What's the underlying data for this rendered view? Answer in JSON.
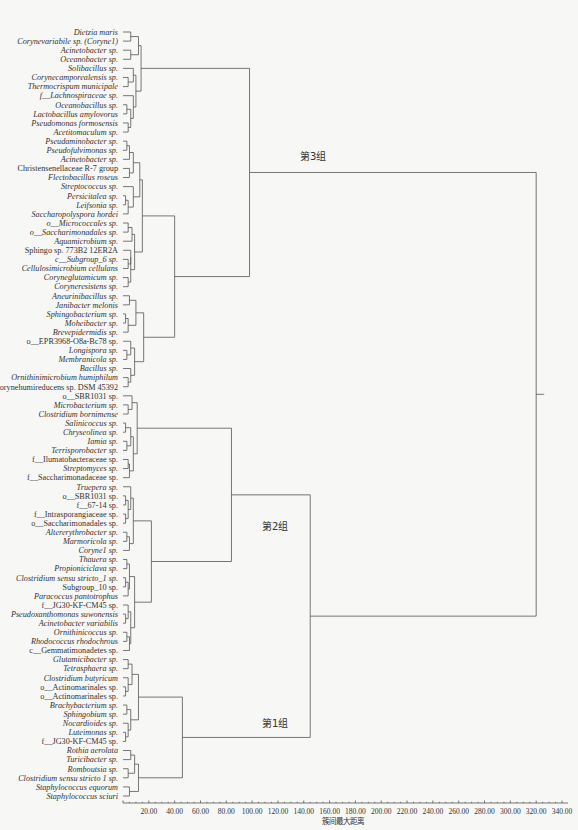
{
  "chart_data": {
    "type": "dendrogram",
    "title": "",
    "xlabel": "簇间最大距离",
    "xlim": [
      0,
      340
    ],
    "x_ticks": [
      "20.00",
      "40.00",
      "60.00",
      "80.00",
      "100.00",
      "120.00",
      "140.00",
      "160.00",
      "180.00",
      "200.00",
      "220.00",
      "240.00",
      "260.00",
      "280.00",
      "300.00",
      "320.00",
      "340.00"
    ],
    "groups": [
      {
        "label": "第3组",
        "first_leaf": 0,
        "last_leaf": 37
      },
      {
        "label": "第2组",
        "first_leaf": 38,
        "last_leaf": 63
      },
      {
        "label": "第1组",
        "first_leaf": 64,
        "last_leaf": 75
      }
    ],
    "leaves": [
      {
        "name": "Dietzia maris",
        "italic": true
      },
      {
        "name": "Corynevariabile sp. (Coryne1)",
        "italic": true
      },
      {
        "name": "Acinetobacter sp.",
        "italic": true
      },
      {
        "name": "Oceanobacter sp.",
        "italic": true
      },
      {
        "name": "Solibacillus sp.",
        "italic": true
      },
      {
        "name": "Corynecamporealensis sp.",
        "italic": true
      },
      {
        "name": "Thermocrispum municipale",
        "italic": true
      },
      {
        "name": "f__Lachnospiraceae sp.",
        "italic": true
      },
      {
        "name": "Oceanobacillus sp.",
        "italic": true
      },
      {
        "name": "Lactobacillus amylovorus",
        "italic": true
      },
      {
        "name": "Pseudomonas formosensis",
        "italic": true
      },
      {
        "name": "Acetitomaculum sp.",
        "italic": true
      },
      {
        "name": "Pseudaminobacter sp.",
        "italic": true
      },
      {
        "name": "Pseudofulvimonas sp.",
        "italic": true
      },
      {
        "name": "Acinetobacter sp.",
        "italic": true
      },
      {
        "name": "Christensenellaceae R-7 group",
        "italic": false
      },
      {
        "name": "Flectobacillus roseus",
        "italic": true
      },
      {
        "name": "Streptococcus sp.",
        "italic": true
      },
      {
        "name": "Persicitalea sp.",
        "italic": true
      },
      {
        "name": "Leifsonia sp.",
        "italic": true
      },
      {
        "name": "Saccharopolyspora hordei",
        "italic": true
      },
      {
        "name": "o__Micrococcales sp.",
        "italic": true
      },
      {
        "name": "o__Saccharimonadales sp.",
        "italic": true
      },
      {
        "name": "Aquamicrobium sp.",
        "italic": true
      },
      {
        "name": "Sphingo sp. 773B2 12ER2A",
        "italic": false
      },
      {
        "name": "c__Subgroup_6 sp.",
        "italic": true
      },
      {
        "name": "Cellulosimicrobium cellulans",
        "italic": true
      },
      {
        "name": "Coryneglutamicum sp.",
        "italic": true
      },
      {
        "name": "Coryneresistens sp.",
        "italic": true
      },
      {
        "name": "Aneurinibacillus sp.",
        "italic": true
      },
      {
        "name": "Janibacter melonis",
        "italic": true
      },
      {
        "name": "Sphingobacterium sp.",
        "italic": true
      },
      {
        "name": "Moheibacter sp.",
        "italic": true
      },
      {
        "name": "Brevepidermidis sp.",
        "italic": true
      },
      {
        "name": "o__EPR3968-O8a-Bc78 sp.",
        "italic": false
      },
      {
        "name": "Longispora sp.",
        "italic": true
      },
      {
        "name": "Membranicola sp.",
        "italic": true
      },
      {
        "name": "Bacillus sp.",
        "italic": true
      },
      {
        "name": "Ornithinimicrobium humiphilum",
        "italic": true
      },
      {
        "name": "Corynehumireducens sp. DSM 45392",
        "italic": false
      },
      {
        "name": "o__SBR1031 sp.",
        "italic": false
      },
      {
        "name": "Microbacterium sp.",
        "italic": true
      },
      {
        "name": "Clostridium bornimense",
        "italic": true
      },
      {
        "name": "Salinicoccus sp.",
        "italic": true
      },
      {
        "name": "Chryseolinea sp.",
        "italic": true
      },
      {
        "name": "Iamia sp.",
        "italic": true
      },
      {
        "name": "Terrisporobacter sp.",
        "italic": true
      },
      {
        "name": "f__Ilumatobacteraceae sp.",
        "italic": false
      },
      {
        "name": "Streptomyces sp.",
        "italic": true
      },
      {
        "name": "f__Saccharimonadaceae sp.",
        "italic": false
      },
      {
        "name": "Truepera sp.",
        "italic": true
      },
      {
        "name": "o__SBR1031 sp.",
        "italic": false
      },
      {
        "name": "f__67-14 sp.",
        "italic": false
      },
      {
        "name": "f__Intrasporangiaceae sp.",
        "italic": false
      },
      {
        "name": "o__Saccharimonadales sp.",
        "italic": false
      },
      {
        "name": "Altererythrobacter sp.",
        "italic": true
      },
      {
        "name": "Marmoricola sp.",
        "italic": true
      },
      {
        "name": "Coryne1 sp.",
        "italic": true
      },
      {
        "name": "Thauera sp.",
        "italic": true
      },
      {
        "name": "Propioniciclava sp.",
        "italic": true
      },
      {
        "name": "Clostridium sensu stricto_1 sp.",
        "italic": true
      },
      {
        "name": "Subgroup_10 sp.",
        "italic": false
      },
      {
        "name": "Paracoccus pantotrophus",
        "italic": true
      },
      {
        "name": "f__JG30-KF-CM45 sp.",
        "italic": false
      },
      {
        "name": "Pseudoxanthomonas suwonensis",
        "italic": true
      },
      {
        "name": "Acinetobacter variabilis",
        "italic": true
      },
      {
        "name": "Ornithinicoccus sp.",
        "italic": true
      },
      {
        "name": "Rhodococcus rhodochrous",
        "italic": true
      },
      {
        "name": "c__Gemmatimonadetes sp.",
        "italic": false
      },
      {
        "name": "Glutamicibacter sp.",
        "italic": true
      },
      {
        "name": "Tetrasphaera sp.",
        "italic": true
      },
      {
        "name": "Clostridium butyricum",
        "italic": true
      },
      {
        "name": "o__Actinomarinales sp.",
        "italic": false
      },
      {
        "name": "o__Actinomarinales sp.",
        "italic": false
      },
      {
        "name": "Brachybacterium sp.",
        "italic": true
      },
      {
        "name": "Sphingobium sp.",
        "italic": true
      },
      {
        "name": "Nocardioides sp.",
        "italic": true
      },
      {
        "name": "Luteimonas sp.",
        "italic": true
      },
      {
        "name": "f__JG30-KF-CM45 sp.",
        "italic": false
      },
      {
        "name": "Rothia aerolata",
        "italic": true
      },
      {
        "name": "Turicibacter sp.",
        "italic": true
      },
      {
        "name": "Romboutsia sp.",
        "italic": true
      },
      {
        "name": "Clostridium sensu stricto 1 sp.",
        "italic": true
      },
      {
        "name": "Staphylococcus equorum",
        "italic": true
      },
      {
        "name": "Staphylococcus sciuri",
        "italic": true
      }
    ],
    "merges": [
      {
        "a": "L0",
        "b": "L1",
        "h": 6,
        "id": "m0"
      },
      {
        "a": "L2",
        "b": "L3",
        "h": 6,
        "id": "m1"
      },
      {
        "a": "m0",
        "b": "m1",
        "h": 12,
        "id": "m2"
      },
      {
        "a": "L5",
        "b": "L6",
        "h": 4,
        "id": "m3"
      },
      {
        "a": "L4",
        "b": "m3",
        "h": 8,
        "id": "m4"
      },
      {
        "a": "L8",
        "b": "L9",
        "h": 3,
        "id": "m5"
      },
      {
        "a": "L10",
        "b": "L11",
        "h": 4,
        "id": "m6"
      },
      {
        "a": "m5",
        "b": "m6",
        "h": 6,
        "id": "m7"
      },
      {
        "a": "L7",
        "b": "m7",
        "h": 8,
        "id": "m7b"
      },
      {
        "a": "m4",
        "b": "m7b",
        "h": 10,
        "id": "m8"
      },
      {
        "a": "m2",
        "b": "m8",
        "h": 14,
        "id": "m9"
      },
      {
        "a": "L12",
        "b": "L13",
        "h": 3,
        "id": "m10"
      },
      {
        "a": "m10",
        "b": "L14",
        "h": 5,
        "id": "m11"
      },
      {
        "a": "L15",
        "b": "L16",
        "h": 5,
        "id": "m12"
      },
      {
        "a": "m11",
        "b": "m12",
        "h": 8,
        "id": "m13"
      },
      {
        "a": "L18",
        "b": "L19",
        "h": 2,
        "id": "m14"
      },
      {
        "a": "m14",
        "b": "L20",
        "h": 4,
        "id": "m15"
      },
      {
        "a": "L17",
        "b": "m15",
        "h": 8,
        "id": "m16"
      },
      {
        "a": "m13",
        "b": "m16",
        "h": 13,
        "id": "m17"
      },
      {
        "a": "L21",
        "b": "L22",
        "h": 4,
        "id": "m18"
      },
      {
        "a": "m18",
        "b": "L23",
        "h": 7,
        "id": "m19"
      },
      {
        "a": "L25",
        "b": "L26",
        "h": 4,
        "id": "m20"
      },
      {
        "a": "L24",
        "b": "m20",
        "h": 6,
        "id": "m21"
      },
      {
        "a": "L27",
        "b": "L28",
        "h": 4,
        "id": "m22"
      },
      {
        "a": "m21",
        "b": "m22",
        "h": 6,
        "id": "m23"
      },
      {
        "a": "m19",
        "b": "m23",
        "h": 9,
        "id": "m24"
      },
      {
        "a": "m17",
        "b": "m24",
        "h": 15,
        "id": "m25"
      },
      {
        "a": "L29",
        "b": "L30",
        "h": 5,
        "id": "m26"
      },
      {
        "a": "L31",
        "b": "L32",
        "h": 2,
        "id": "m27"
      },
      {
        "a": "m27",
        "b": "L33",
        "h": 4,
        "id": "m28"
      },
      {
        "a": "m26",
        "b": "m28",
        "h": 10,
        "id": "m29"
      },
      {
        "a": "L35",
        "b": "L36",
        "h": 3,
        "id": "m30"
      },
      {
        "a": "L34",
        "b": "m30",
        "h": 6,
        "id": "m31"
      },
      {
        "a": "L38",
        "b": "L39",
        "h": 4,
        "id": "m32"
      },
      {
        "a": "L37",
        "b": "m32",
        "h": 6,
        "id": "m33"
      },
      {
        "a": "m31",
        "b": "m33",
        "h": 9,
        "id": "m34"
      },
      {
        "a": "m29",
        "b": "m34",
        "h": 16,
        "id": "m35"
      },
      {
        "a": "m25",
        "b": "m35",
        "h": 40,
        "id": "m36"
      },
      {
        "a": "m9",
        "b": "m36",
        "h": 98,
        "id": "G3"
      },
      {
        "a": "L41",
        "b": "L42",
        "h": 4,
        "id": "n0"
      },
      {
        "a": "L40",
        "b": "n0",
        "h": 7,
        "id": "n1"
      },
      {
        "a": "L43",
        "b": "L44",
        "h": 2,
        "id": "n2"
      },
      {
        "a": "L45",
        "b": "L46",
        "h": 3,
        "id": "n3"
      },
      {
        "a": "n2",
        "b": "n3",
        "h": 6,
        "id": "n4"
      },
      {
        "a": "L47",
        "b": "L48",
        "h": 4,
        "id": "n5"
      },
      {
        "a": "n5",
        "b": "L49",
        "h": 5,
        "id": "n6"
      },
      {
        "a": "n4",
        "b": "n6",
        "h": 8,
        "id": "n7"
      },
      {
        "a": "n1",
        "b": "n7",
        "h": 11,
        "id": "n8"
      },
      {
        "a": "L51",
        "b": "L52",
        "h": 2,
        "id": "n9"
      },
      {
        "a": "L53",
        "b": "L54",
        "h": 2,
        "id": "n10"
      },
      {
        "a": "n9",
        "b": "n10",
        "h": 4,
        "id": "n11"
      },
      {
        "a": "L50",
        "b": "n11",
        "h": 6,
        "id": "n12"
      },
      {
        "a": "L55",
        "b": "L56",
        "h": 3,
        "id": "n13"
      },
      {
        "a": "n13",
        "b": "L57",
        "h": 5,
        "id": "n14"
      },
      {
        "a": "n12",
        "b": "n14",
        "h": 8,
        "id": "n15"
      },
      {
        "a": "L58",
        "b": "L59",
        "h": 3,
        "id": "n16"
      },
      {
        "a": "L60",
        "b": "L61",
        "h": 2,
        "id": "n17"
      },
      {
        "a": "n17",
        "b": "L62",
        "h": 4,
        "id": "n18"
      },
      {
        "a": "n16",
        "b": "n18",
        "h": 5,
        "id": "n19"
      },
      {
        "a": "L64",
        "b": "L65",
        "h": 2,
        "id": "n20"
      },
      {
        "a": "L63",
        "b": "n20",
        "h": 4,
        "id": "n21"
      },
      {
        "a": "L66",
        "b": "L67",
        "h": 3,
        "id": "n22"
      },
      {
        "a": "n22",
        "b": "L68",
        "h": 5,
        "id": "n23"
      },
      {
        "a": "n21",
        "b": "n23",
        "h": 6,
        "id": "n24"
      },
      {
        "a": "n19",
        "b": "n24",
        "h": 9,
        "id": "n25"
      },
      {
        "a": "n15",
        "b": "n25",
        "h": 22,
        "id": "n26"
      },
      {
        "a": "n8",
        "b": "n26",
        "h": 84,
        "id": "G2"
      },
      {
        "a": "L69",
        "b": "L70",
        "h": 4,
        "id": "k0"
      },
      {
        "a": "L72",
        "b": "L73",
        "h": 2,
        "id": "k1"
      },
      {
        "a": "L71",
        "b": "k1",
        "h": 4,
        "id": "k2"
      },
      {
        "a": "k0",
        "b": "k2",
        "h": 7,
        "id": "k3"
      },
      {
        "a": "L74",
        "b": "L75",
        "h": 3,
        "id": "k4"
      },
      {
        "a": "L77",
        "b": "L78",
        "h": 2,
        "id": "k5"
      },
      {
        "a": "L76",
        "b": "k5",
        "h": 4,
        "id": "k6"
      },
      {
        "a": "k4",
        "b": "k6",
        "h": 6,
        "id": "k7"
      },
      {
        "a": "k3",
        "b": "k7",
        "h": 12,
        "id": "k8"
      },
      {
        "a": "L79",
        "b": "L80",
        "h": 6,
        "id": "k9"
      },
      {
        "a": "L81",
        "b": "L82",
        "h": 4,
        "id": "k10"
      },
      {
        "a": "k9",
        "b": "k10",
        "h": 9,
        "id": "k11"
      },
      {
        "a": "L83",
        "b": "L84",
        "h": 5,
        "id": "k12"
      },
      {
        "a": "k11",
        "b": "k12",
        "h": 12,
        "id": "k13"
      },
      {
        "a": "k8",
        "b": "k13",
        "h": 46,
        "id": "G1"
      },
      {
        "a": "G2",
        "b": "G1",
        "h": 145,
        "id": "G12"
      },
      {
        "a": "G3",
        "b": "G12",
        "h": 320,
        "id": "ROOT"
      }
    ]
  }
}
